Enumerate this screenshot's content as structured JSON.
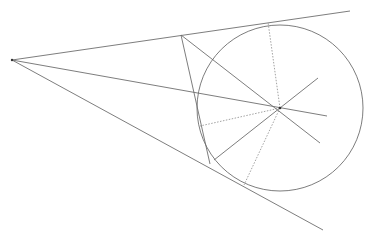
{
  "diagram": {
    "colors": {
      "line": "#6e6e6e",
      "dotted": "#8a8a8a",
      "point": "#333333",
      "background": "#ffffff"
    },
    "points": {
      "apex": [
        12,
        60
      ],
      "center": [
        280,
        108
      ],
      "upper_tangent_point": [
        268,
        22
      ],
      "lower_tangent_point": [
        248,
        189
      ],
      "P_upper": [
        181,
        35
      ],
      "Q_lower": [
        210,
        164
      ],
      "left_radius_end": [
        200,
        126
      ]
    },
    "circle": {
      "cx": 280,
      "cy": 108,
      "r": 83
    },
    "solid_lines": [
      {
        "name": "upper-tangent-line",
        "from": [
          12,
          60
        ],
        "to": [
          350,
          11
        ]
      },
      {
        "name": "lower-tangent-line",
        "from": [
          12,
          60
        ],
        "to": [
          323,
          230
        ]
      },
      {
        "name": "secant-through-center",
        "from": [
          12,
          60
        ],
        "to": [
          327,
          116
        ]
      },
      {
        "name": "segment-P-Q",
        "from": [
          181,
          35
        ],
        "to": [
          210,
          164
        ]
      },
      {
        "name": "line-P-through-center",
        "from": [
          181,
          35
        ],
        "to": [
          320,
          143
        ]
      },
      {
        "name": "line-Q-through-center",
        "from": [
          214,
          160
        ],
        "to": [
          318,
          78
        ]
      }
    ],
    "dotted_lines": [
      {
        "name": "radius-to-upper-tangent",
        "from": [
          280,
          108
        ],
        "to": [
          268,
          22
        ]
      },
      {
        "name": "radius-to-lower-tangent",
        "from": [
          280,
          108
        ],
        "to": [
          244,
          185
        ]
      },
      {
        "name": "radius-to-left",
        "from": [
          280,
          108
        ],
        "to": [
          200,
          126
        ]
      }
    ]
  }
}
